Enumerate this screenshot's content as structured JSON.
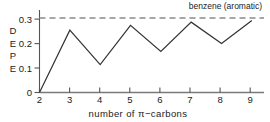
{
  "chart_data": {
    "type": "line",
    "title": "",
    "xlabel": "number of π−carbons",
    "ylabel": "DEPE",
    "x": [
      2,
      3,
      4,
      5,
      6,
      7,
      8,
      9
    ],
    "values": [
      0.0,
      0.272,
      0.122,
      0.293,
      0.179,
      0.307,
      0.214,
      0.314
    ],
    "series": [
      {
        "name": "DEPE",
        "x": [
          2,
          3,
          4,
          5,
          6,
          7,
          8,
          9
        ],
        "values": [
          0.0,
          0.272,
          0.122,
          0.293,
          0.179,
          0.307,
          0.214,
          0.314
        ],
        "style": "solid"
      }
    ],
    "reference_lines": [
      {
        "label": "benzene (aromatic)",
        "value": 0.325,
        "style": "dashed",
        "orientation": "horizontal"
      }
    ],
    "xlim": [
      2,
      9.4
    ],
    "ylim": [
      0,
      0.36
    ],
    "xticks": [
      2,
      3,
      4,
      5,
      6,
      7,
      8,
      9
    ],
    "xticklabels": [
      "2",
      "3",
      "4",
      "5",
      "6",
      "7",
      "8",
      "9"
    ],
    "yticks": [
      0,
      0.1,
      0.2,
      0.3
    ],
    "yticklabels": [
      "0",
      "0.1",
      "0.2",
      "0.3"
    ],
    "grid": false,
    "legend": "none",
    "line_color": "#333333",
    "reference_color": "#8a8a8a",
    "axis_color": "#555555"
  },
  "axes": {
    "y_label_chars": [
      "D",
      "E",
      "P",
      "E"
    ],
    "x_caption": "number of π−carbons",
    "y_tick_labels": [
      "0.3",
      "0.2",
      "0.1",
      "0"
    ],
    "x_tick_labels": [
      "2",
      "3",
      "4",
      "5",
      "6",
      "7",
      "8",
      "9"
    ]
  },
  "annotations": {
    "benzene_label": "benzene (aromatic)"
  }
}
